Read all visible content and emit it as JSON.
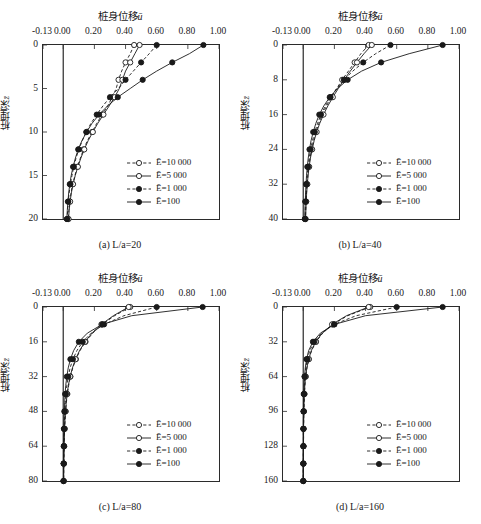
{
  "figure": {
    "axis_title": "桩身位移",
    "axis_title_symbol": "ū",
    "ylabel": "桩埋深",
    "ylabel_symbol": "z̄"
  },
  "legend": {
    "entries": [
      {
        "label": "Ē=10 000",
        "symbol": "E",
        "value": "10 000",
        "marker": "open-circle",
        "line": "dashed"
      },
      {
        "label": "Ē=5 000",
        "symbol": "E",
        "value": "5 000",
        "marker": "open-circle",
        "line": "solid"
      },
      {
        "label": "Ē=1 000",
        "symbol": "E",
        "value": "1 000",
        "marker": "filled-circle",
        "line": "dashed"
      },
      {
        "label": "Ē=100",
        "symbol": "E",
        "value": "100",
        "marker": "filled-circle",
        "line": "solid"
      }
    ]
  },
  "chart_data": [
    {
      "type": "line",
      "panel": "a",
      "caption": "(a) L/a=20",
      "title": "桩身位移ū",
      "xlabel": "桩身位移ū",
      "ylabel": "桩埋深z̄",
      "xlim": [
        -0.13,
        1.0
      ],
      "ylim": [
        0,
        20
      ],
      "y_inverted": true,
      "xticks": [
        -0.13,
        0.0,
        0.2,
        0.4,
        0.6,
        0.8,
        1.0
      ],
      "xticklabels": [
        "-0.13",
        "0.00",
        "0.20",
        "0.40",
        "0.60",
        "0.80",
        "1.00"
      ],
      "yticks": [
        0,
        5,
        10,
        15,
        20
      ],
      "yticklabels": [
        "0",
        "5",
        "10",
        "15",
        "20"
      ],
      "grid": false,
      "legend_position": "lower-right",
      "series": [
        {
          "name": "Ē=10 000",
          "line": "dashed",
          "marker": "open-circle",
          "x": [
            0.455,
            0.43,
            0.4,
            0.375,
            0.355,
            0.34,
            0.315,
            0.285,
            0.25,
            0.215,
            0.185,
            0.155,
            0.13,
            0.11,
            0.09,
            0.075,
            0.06,
            0.05,
            0.042,
            0.036,
            0.032
          ],
          "y": [
            0,
            1,
            2,
            3,
            4,
            5,
            6,
            7,
            8,
            9,
            10,
            11,
            12,
            13,
            14,
            15,
            16,
            17,
            18,
            19,
            20
          ]
        },
        {
          "name": "Ē=5 000",
          "line": "solid",
          "marker": "open-circle",
          "x": [
            0.49,
            0.46,
            0.43,
            0.4,
            0.38,
            0.36,
            0.33,
            0.295,
            0.258,
            0.222,
            0.19,
            0.16,
            0.135,
            0.113,
            0.094,
            0.077,
            0.063,
            0.052,
            0.044,
            0.038,
            0.034
          ],
          "y": [
            0,
            1,
            2,
            3,
            4,
            5,
            6,
            7,
            8,
            9,
            10,
            11,
            12,
            13,
            14,
            15,
            16,
            17,
            18,
            19,
            20
          ]
        },
        {
          "name": "Ē=1 000",
          "line": "dashed",
          "marker": "filled-circle",
          "x": [
            0.6,
            0.552,
            0.5,
            0.45,
            0.4,
            0.355,
            0.3,
            0.255,
            0.215,
            0.178,
            0.148,
            0.122,
            0.1,
            0.082,
            0.068,
            0.056,
            0.046,
            0.038,
            0.032,
            0.028,
            0.025
          ],
          "y": [
            0,
            1,
            2,
            3,
            4,
            5,
            6,
            7,
            8,
            9,
            10,
            11,
            12,
            13,
            14,
            15,
            16,
            17,
            18,
            19,
            20
          ]
        },
        {
          "name": "Ē=100",
          "line": "solid",
          "marker": "filled-circle",
          "x": [
            0.9,
            0.81,
            0.7,
            0.6,
            0.51,
            0.43,
            0.35,
            0.285,
            0.23,
            0.185,
            0.15,
            0.12,
            0.096,
            0.078,
            0.063,
            0.051,
            0.042,
            0.035,
            0.03,
            0.026,
            0.023
          ],
          "y": [
            0,
            1,
            2,
            3,
            4,
            5,
            6,
            7,
            8,
            9,
            10,
            11,
            12,
            13,
            14,
            15,
            16,
            17,
            18,
            19,
            20
          ]
        }
      ]
    },
    {
      "type": "line",
      "panel": "b",
      "caption": "(b) L/a=40",
      "title": "桩身位移ū",
      "xlabel": "桩身位移ū",
      "ylabel": "桩埋深z̄",
      "xlim": [
        -0.13,
        1.0
      ],
      "ylim": [
        0,
        40
      ],
      "y_inverted": true,
      "xticks": [
        -0.13,
        0.0,
        0.2,
        0.4,
        0.6,
        0.8,
        1.0
      ],
      "xticklabels": [
        "-0.13",
        "0.00",
        "0.20",
        "0.40",
        "0.60",
        "0.80",
        "1.00"
      ],
      "yticks": [
        0,
        8,
        16,
        24,
        32,
        40
      ],
      "yticklabels": [
        "0",
        "8",
        "16",
        "24",
        "32",
        "40"
      ],
      "grid": false,
      "legend_position": "lower-right",
      "series": [
        {
          "name": "Ē=10 000",
          "line": "dashed",
          "marker": "open-circle",
          "x": [
            0.42,
            0.37,
            0.33,
            0.29,
            0.25,
            0.215,
            0.18,
            0.15,
            0.122,
            0.1,
            0.082,
            0.066,
            0.054,
            0.044,
            0.036,
            0.03,
            0.025,
            0.021,
            0.018,
            0.016,
            0.014
          ],
          "y": [
            0,
            2,
            4,
            6,
            8,
            10,
            12,
            14,
            16,
            18,
            20,
            22,
            24,
            26,
            28,
            30,
            32,
            34,
            36,
            38,
            40
          ]
        },
        {
          "name": "Ē=5 000",
          "line": "solid",
          "marker": "open-circle",
          "x": [
            0.44,
            0.39,
            0.345,
            0.302,
            0.262,
            0.225,
            0.19,
            0.158,
            0.13,
            0.106,
            0.086,
            0.07,
            0.057,
            0.046,
            0.038,
            0.031,
            0.026,
            0.022,
            0.019,
            0.017,
            0.015
          ],
          "y": [
            0,
            2,
            4,
            6,
            8,
            10,
            12,
            14,
            16,
            18,
            20,
            22,
            24,
            26,
            28,
            30,
            32,
            34,
            36,
            38,
            40
          ]
        },
        {
          "name": "Ē=1 000",
          "line": "dashed",
          "marker": "filled-circle",
          "x": [
            0.56,
            0.465,
            0.385,
            0.318,
            0.262,
            0.215,
            0.175,
            0.142,
            0.114,
            0.092,
            0.074,
            0.059,
            0.047,
            0.038,
            0.031,
            0.025,
            0.021,
            0.018,
            0.015,
            0.013,
            0.012
          ],
          "y": [
            0,
            2,
            4,
            6,
            8,
            10,
            12,
            14,
            16,
            18,
            20,
            22,
            24,
            26,
            28,
            30,
            32,
            34,
            36,
            38,
            40
          ]
        },
        {
          "name": "Ē=100",
          "line": "solid",
          "marker": "filled-circle",
          "x": [
            0.895,
            0.68,
            0.5,
            0.375,
            0.285,
            0.22,
            0.17,
            0.132,
            0.103,
            0.081,
            0.064,
            0.05,
            0.04,
            0.032,
            0.026,
            0.021,
            0.018,
            0.015,
            0.013,
            0.011,
            0.01
          ],
          "y": [
            0,
            2,
            4,
            6,
            8,
            10,
            12,
            14,
            16,
            18,
            20,
            22,
            24,
            26,
            28,
            30,
            32,
            34,
            36,
            38,
            40
          ]
        }
      ]
    },
    {
      "type": "line",
      "panel": "c",
      "caption": "(c) L/a=80",
      "title": "桩身位移ū",
      "xlabel": "桩身位移ū",
      "ylabel": "桩埋深z̄",
      "xlim": [
        -0.13,
        1.0
      ],
      "ylim": [
        0,
        80
      ],
      "y_inverted": true,
      "xticks": [
        -0.13,
        0.0,
        0.2,
        0.4,
        0.6,
        0.8,
        1.0
      ],
      "xticklabels": [
        "-0.13",
        "0.00",
        "0.20",
        "0.40",
        "0.60",
        "0.80",
        "1.00"
      ],
      "yticks": [
        0,
        16,
        32,
        48,
        64,
        80
      ],
      "yticklabels": [
        "0",
        "16",
        "32",
        "48",
        "64",
        "80"
      ],
      "grid": false,
      "legend_position": "lower-right",
      "series": [
        {
          "name": "Ē=10 000",
          "line": "dashed",
          "marker": "open-circle",
          "x": [
            0.43,
            0.33,
            0.25,
            0.19,
            0.143,
            0.108,
            0.081,
            0.061,
            0.046,
            0.035,
            0.026,
            0.02,
            0.015,
            0.012,
            0.009,
            0.007,
            0.006,
            0.005,
            0.004,
            0.003,
            0.003
          ],
          "y": [
            0,
            4,
            8,
            12,
            16,
            20,
            24,
            28,
            32,
            36,
            40,
            44,
            48,
            52,
            56,
            60,
            64,
            68,
            72,
            76,
            80
          ]
        },
        {
          "name": "Ē=5 000",
          "line": "solid",
          "marker": "open-circle",
          "x": [
            0.42,
            0.322,
            0.245,
            0.185,
            0.14,
            0.105,
            0.079,
            0.059,
            0.044,
            0.033,
            0.025,
            0.019,
            0.015,
            0.011,
            0.009,
            0.007,
            0.006,
            0.005,
            0.004,
            0.003,
            0.003
          ],
          "y": [
            0,
            4,
            8,
            12,
            16,
            20,
            24,
            28,
            32,
            36,
            40,
            44,
            48,
            52,
            56,
            60,
            64,
            68,
            72,
            76,
            80
          ]
        },
        {
          "name": "Ē=1 000",
          "line": "dashed",
          "marker": "filled-circle",
          "x": [
            0.6,
            0.39,
            0.262,
            0.18,
            0.125,
            0.088,
            0.062,
            0.044,
            0.032,
            0.023,
            0.017,
            0.013,
            0.01,
            0.008,
            0.006,
            0.005,
            0.004,
            0.003,
            0.003,
            0.002,
            0.002
          ],
          "y": [
            0,
            4,
            8,
            12,
            16,
            20,
            24,
            28,
            32,
            36,
            40,
            44,
            48,
            52,
            56,
            60,
            64,
            68,
            72,
            76,
            80
          ]
        },
        {
          "name": "Ē=100",
          "line": "solid",
          "marker": "filled-circle",
          "x": [
            0.895,
            0.44,
            0.25,
            0.155,
            0.1,
            0.067,
            0.046,
            0.032,
            0.023,
            0.016,
            0.012,
            0.009,
            0.007,
            0.005,
            0.004,
            0.003,
            0.003,
            0.002,
            0.002,
            0.002,
            0.001
          ],
          "y": [
            0,
            4,
            8,
            12,
            16,
            20,
            24,
            28,
            32,
            36,
            40,
            44,
            48,
            52,
            56,
            60,
            64,
            68,
            72,
            76,
            80
          ]
        }
      ]
    },
    {
      "type": "line",
      "panel": "d",
      "caption": "(d) L/a=160",
      "title": "桩身位移ū",
      "xlabel": "桩身位移ū",
      "ylabel": "桩埋深z̄",
      "xlim": [
        -0.13,
        1.0
      ],
      "ylim": [
        0,
        160
      ],
      "y_inverted": true,
      "xticks": [
        -0.13,
        0.0,
        0.2,
        0.4,
        0.6,
        0.8,
        1.0
      ],
      "xticklabels": [
        "-0.13",
        "0.00",
        "0.20",
        "0.40",
        "0.60",
        "0.80",
        "1.00"
      ],
      "yticks": [
        0,
        32,
        64,
        96,
        128,
        160
      ],
      "yticklabels": [
        "0",
        "32",
        "64",
        "96",
        "128",
        "160"
      ],
      "grid": false,
      "legend_position": "lower-right",
      "series": [
        {
          "name": "Ē=10 000",
          "line": "dashed",
          "marker": "open-circle",
          "x": [
            0.43,
            0.285,
            0.19,
            0.125,
            0.082,
            0.054,
            0.036,
            0.024,
            0.016,
            0.011,
            0.008,
            0.006,
            0.004,
            0.003,
            0.002,
            0.002,
            0.002,
            0.001,
            0.001,
            0.001,
            0.001
          ],
          "y": [
            0,
            8,
            16,
            24,
            32,
            40,
            48,
            56,
            64,
            72,
            80,
            88,
            96,
            104,
            112,
            120,
            128,
            136,
            144,
            152,
            160
          ]
        },
        {
          "name": "Ē=5 000",
          "line": "solid",
          "marker": "open-circle",
          "x": [
            0.42,
            0.278,
            0.185,
            0.122,
            0.08,
            0.052,
            0.035,
            0.023,
            0.015,
            0.01,
            0.007,
            0.005,
            0.004,
            0.003,
            0.002,
            0.002,
            0.001,
            0.001,
            0.001,
            0.001,
            0.001
          ],
          "y": [
            0,
            8,
            16,
            24,
            32,
            40,
            48,
            56,
            64,
            72,
            80,
            88,
            96,
            104,
            112,
            120,
            128,
            136,
            144,
            152,
            160
          ]
        },
        {
          "name": "Ē=1 000",
          "line": "dashed",
          "marker": "filled-circle",
          "x": [
            0.6,
            0.34,
            0.198,
            0.118,
            0.07,
            0.042,
            0.026,
            0.016,
            0.01,
            0.007,
            0.005,
            0.003,
            0.002,
            0.002,
            0.001,
            0.001,
            0.001,
            0.001,
            0.001,
            0.0,
            0.0
          ],
          "y": [
            0,
            8,
            16,
            24,
            32,
            40,
            48,
            56,
            64,
            72,
            80,
            88,
            96,
            104,
            112,
            120,
            128,
            136,
            144,
            152,
            160
          ]
        },
        {
          "name": "Ē=100",
          "line": "solid",
          "marker": "filled-circle",
          "x": [
            0.895,
            0.4,
            0.2,
            0.11,
            0.062,
            0.035,
            0.021,
            0.013,
            0.008,
            0.005,
            0.003,
            0.002,
            0.002,
            0.001,
            0.001,
            0.001,
            0.001,
            0.0,
            0.0,
            0.0,
            0.0
          ],
          "y": [
            0,
            8,
            16,
            24,
            32,
            40,
            48,
            56,
            64,
            72,
            80,
            88,
            96,
            104,
            112,
            120,
            128,
            136,
            144,
            152,
            160
          ]
        }
      ]
    }
  ]
}
